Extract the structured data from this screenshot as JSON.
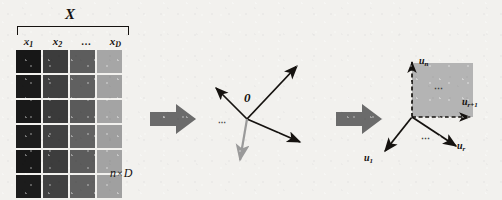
{
  "figure": {
    "background_color": "#f2f1ee",
    "ink_color": "#15120f",
    "block_arrow_color": "#6b6b6b",
    "subspace_fill_color": "#b4b4b4",
    "gray_vector_color": "#9a9a9a"
  },
  "matrix_panel": {
    "title": "X",
    "column_labels": [
      {
        "base": "x",
        "sub": "1"
      },
      {
        "base": "x",
        "sub": "2"
      },
      {
        "base": "…",
        "sub": ""
      },
      {
        "base": "x",
        "sub": "D"
      }
    ],
    "size_label": {
      "rows": "n",
      "times": "×",
      "cols": "D"
    },
    "column_shades": [
      "#1b1b1b",
      "#3e3e3e",
      "#5f5f5f",
      "#a2a2a2"
    ],
    "rows": 6,
    "cols": 4,
    "cell_colors": [
      [
        "#171717",
        "#3c3c3c",
        "#5d5d5d",
        "#a6a6a6"
      ],
      [
        "#1b1b1b",
        "#404040",
        "#606060",
        "#a1a1a1"
      ],
      [
        "#191919",
        "#3a3a3a",
        "#5a5a5a",
        "#a4a4a4"
      ],
      [
        "#1d1d1d",
        "#424242",
        "#626262",
        "#9e9e9e"
      ],
      [
        "#181818",
        "#3d3d3d",
        "#5c5c5c",
        "#a3a3a3"
      ],
      [
        "#1c1c1c",
        "#414141",
        "#616161",
        "#a0a0a0"
      ]
    ]
  },
  "arrow_1": {
    "name": "transform-arrow-1",
    "direction": "right"
  },
  "arrow_2": {
    "name": "transform-arrow-2",
    "direction": "right"
  },
  "vector_panel": {
    "origin_label": "0",
    "ellipsis": "⋯",
    "vectors": [
      {
        "name": "vector-up-left",
        "color": "#15120f",
        "style": "solid"
      },
      {
        "name": "vector-up-right",
        "color": "#15120f",
        "style": "solid"
      },
      {
        "name": "vector-down-right",
        "color": "#15120f",
        "style": "solid"
      },
      {
        "name": "vector-down-gray",
        "color": "#9a9a9a",
        "style": "solid"
      }
    ]
  },
  "basis_panel": {
    "ellipsis_inside": "⋯",
    "ellipsis_below": "⋯",
    "subspace_fill": "#b4b4b4",
    "axes": [
      {
        "id": "u_n",
        "base": "u",
        "sub": "n",
        "style": "dashed",
        "direction": "up"
      },
      {
        "id": "u_r1",
        "base": "u",
        "sub": "r+1",
        "style": "dashed",
        "direction": "right"
      },
      {
        "id": "u_1",
        "base": "u",
        "sub": "1",
        "style": "solid",
        "direction": "down-left"
      },
      {
        "id": "u_r",
        "base": "u",
        "sub": "r",
        "style": "solid",
        "direction": "down-right"
      }
    ]
  }
}
